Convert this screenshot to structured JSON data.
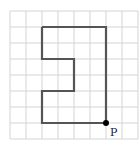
{
  "grid": {
    "cols": 8,
    "rows": 8,
    "origin_x": 10,
    "origin_y": 11,
    "cell": 16,
    "line_color": "#d4d4d4",
    "background": "#ffffff"
  },
  "shape": {
    "stroke": "#555555",
    "stroke_width": 2.2,
    "vertices_grid": [
      [
        2,
        1
      ],
      [
        6,
        1
      ],
      [
        6,
        7
      ],
      [
        2,
        7
      ],
      [
        2,
        5
      ],
      [
        4,
        5
      ],
      [
        4,
        3
      ],
      [
        2,
        3
      ],
      [
        2,
        1
      ]
    ]
  },
  "point": {
    "label": "P",
    "grid_pos": [
      6,
      7
    ],
    "color": "#000000"
  }
}
